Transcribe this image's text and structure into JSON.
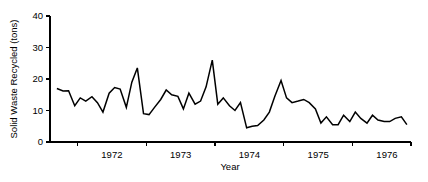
{
  "chart_data": {
    "type": "line",
    "title": "",
    "xlabel": "Year",
    "ylabel": "Solid Waste Recycled (tons)",
    "ylim": [
      0,
      40
    ],
    "yticks": [
      0,
      10,
      20,
      30,
      40
    ],
    "ytick_labels": [
      "0",
      "10",
      "20",
      "30",
      "40"
    ],
    "xlim": [
      1971.6,
      1976.85
    ],
    "xticks": [
      1972.0,
      1973.0,
      1974.0,
      1975.0,
      1976.0
    ],
    "xtick_labels": [
      "1972",
      "1973",
      "1974",
      "1975",
      "1976"
    ],
    "xtick_label_positions": [
      1972.5,
      1973.5,
      1974.5,
      1975.5,
      1976.5
    ],
    "grid": false,
    "legend": null,
    "legend_position": "none",
    "line_color": "#000000",
    "background_color": "#ffffff",
    "series": [
      {
        "name": "Solid Waste Recycled",
        "x": [
          1971.7,
          1971.79,
          1971.87,
          1971.96,
          1972.04,
          1972.12,
          1972.21,
          1972.29,
          1972.37,
          1972.46,
          1972.54,
          1972.62,
          1972.71,
          1972.79,
          1972.87,
          1972.96,
          1973.04,
          1973.12,
          1973.21,
          1973.29,
          1973.37,
          1973.46,
          1973.54,
          1973.62,
          1973.71,
          1973.79,
          1973.87,
          1973.96,
          1974.04,
          1974.12,
          1974.21,
          1974.29,
          1974.37,
          1974.46,
          1974.54,
          1974.62,
          1974.71,
          1974.79,
          1974.87,
          1974.96,
          1975.04,
          1975.12,
          1975.21,
          1975.29,
          1975.37,
          1975.46,
          1975.54,
          1975.62,
          1975.71,
          1975.79,
          1975.87,
          1975.96,
          1976.04,
          1976.12,
          1976.21,
          1976.29,
          1976.37,
          1976.46,
          1976.54,
          1976.62,
          1976.71,
          1976.79
        ],
        "y": [
          17.0,
          16.2,
          16.3,
          11.5,
          14.0,
          13.0,
          14.4,
          12.5,
          9.5,
          15.5,
          17.3,
          16.8,
          11.0,
          19.0,
          23.5,
          9.0,
          8.7,
          11.0,
          13.5,
          16.5,
          15.0,
          14.5,
          10.5,
          15.5,
          12.0,
          13.0,
          17.5,
          26.0,
          12.0,
          14.0,
          11.5,
          10.0,
          12.5,
          4.5,
          5.0,
          5.2,
          7.0,
          9.5,
          14.5,
          19.5,
          14.0,
          12.5,
          13.0,
          13.5,
          12.5,
          10.5,
          6.0,
          8.0,
          5.5,
          5.5,
          8.5,
          6.5,
          9.5,
          7.5,
          6.0,
          8.5,
          7.0,
          6.5,
          6.5,
          7.5,
          8.0,
          5.5
        ]
      }
    ]
  },
  "figure": {
    "plot_area": {
      "left": 50,
      "right": 411,
      "top": 16,
      "bottom": 142
    }
  }
}
